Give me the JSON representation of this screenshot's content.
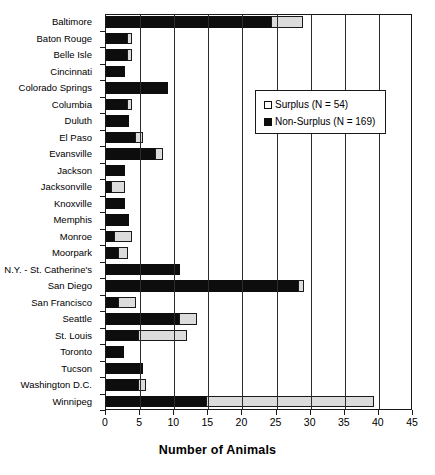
{
  "chart_data": {
    "type": "bar",
    "orientation": "horizontal",
    "stacked": true,
    "title": "",
    "xlabel": "Number of Animals",
    "ylabel": "",
    "xlim": [
      0,
      45
    ],
    "xticks": [
      0,
      5,
      10,
      15,
      20,
      25,
      30,
      35,
      40,
      45
    ],
    "grid": true,
    "legend_position": "upper right",
    "legend": [
      {
        "name": "Surplus (N = 54)",
        "key": "surplus",
        "swatch": "open-square",
        "color": "#dcdcdc"
      },
      {
        "name": "Non-Surplus (N = 169)",
        "key": "non_surplus",
        "swatch": "filled-square",
        "color": "#0d0d0d"
      }
    ],
    "categories": [
      "Baltimore",
      "Baton Rouge",
      "Belle Isle",
      "Cincinnati",
      "Colorado Springs",
      "Columbia",
      "Duluth",
      "El Paso",
      "Evansville",
      "Jackson",
      "Jacksonville",
      "Knoxville",
      "Memphis",
      "Monroe",
      "Moorpark",
      "N.Y. - St. Catherine's",
      "San Diego",
      "San Francisco",
      "Seattle",
      "St. Louis",
      "Toronto",
      "Tucson",
      "Washington D.C.",
      "Winnipeg"
    ],
    "series": [
      {
        "name": "Non-Surplus (N = 169)",
        "key": "non_surplus",
        "values": [
          24.5,
          3.3,
          3.3,
          3.0,
          9.3,
          3.3,
          3.5,
          4.5,
          7.5,
          3.0,
          1.0,
          3.0,
          3.5,
          1.5,
          2.0,
          11.0,
          28.5,
          2.0,
          11.0,
          5.0,
          2.8,
          5.5,
          5.0,
          15.0
        ]
      },
      {
        "name": "Surplus (N = 54)",
        "key": "surplus",
        "values": [
          4.5,
          0.7,
          0.7,
          0.0,
          0.0,
          0.7,
          0.0,
          1.0,
          1.0,
          0.0,
          2.0,
          0.0,
          0.0,
          2.5,
          1.3,
          0.0,
          0.6,
          2.5,
          2.5,
          7.0,
          0.0,
          0.0,
          1.0,
          24.5
        ]
      }
    ],
    "totals": [
      29.0,
      4.0,
      4.0,
      3.0,
      9.3,
      4.0,
      3.5,
      5.5,
      8.5,
      3.0,
      3.0,
      3.0,
      3.5,
      4.0,
      3.3,
      11.0,
      29.1,
      4.5,
      13.5,
      12.0,
      2.8,
      5.5,
      6.0,
      39.5
    ]
  }
}
